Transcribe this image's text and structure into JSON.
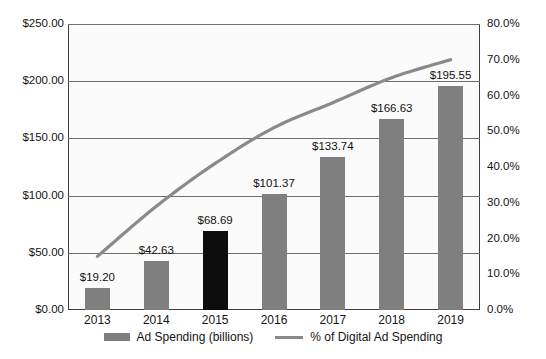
{
  "chart_data": {
    "type": "bar",
    "title": "",
    "subtitle": "",
    "xlabel": "",
    "ylabel": "",
    "categories": [
      "2013",
      "2014",
      "2015",
      "2016",
      "2017",
      "2018",
      "2019"
    ],
    "grid": "horizontal",
    "legend_position": "bottom",
    "axes": {
      "left": {
        "label": "",
        "ylim": [
          0,
          250
        ],
        "tick_step": 50,
        "ticks": [
          "$0.00",
          "$50.00",
          "$100.00",
          "$150.00",
          "$200.00",
          "$250.00"
        ],
        "tick_values": [
          0,
          50,
          100,
          150,
          200,
          250
        ]
      },
      "right": {
        "label": "",
        "ylim": [
          0,
          80
        ],
        "tick_step": 10,
        "ticks": [
          "0.0%",
          "10.0%",
          "20.0%",
          "30.0%",
          "40.0%",
          "50.0%",
          "60.0%",
          "70.0%",
          "80.0%"
        ],
        "tick_values": [
          0,
          10,
          20,
          30,
          40,
          50,
          60,
          70,
          80
        ]
      }
    },
    "series": [
      {
        "name": "Ad Spending (billions)",
        "type": "bar",
        "axis": "left",
        "color": "#7f7f7f",
        "highlight_color": "#0d0d0d",
        "highlight_category": "2015",
        "values": [
          19.2,
          42.63,
          68.69,
          101.37,
          133.74,
          166.63,
          195.55
        ],
        "labels": [
          "$19.20",
          "$42.63",
          "$68.69",
          "$101.37",
          "$133.74",
          "$166.63",
          "$195.55"
        ]
      },
      {
        "name": "% of Digital Ad Spending",
        "type": "line",
        "axis": "right",
        "color": "#8a8a8a",
        "values": [
          15.0,
          29.0,
          41.0,
          51.0,
          58.0,
          65.0,
          70.0
        ]
      }
    ]
  },
  "legend": {
    "entries": [
      {
        "label": "Ad Spending (billions)",
        "marker": "bar-swatch-icon"
      },
      {
        "label": "% of Digital Ad Spending",
        "marker": "line-swatch-icon"
      }
    ]
  }
}
